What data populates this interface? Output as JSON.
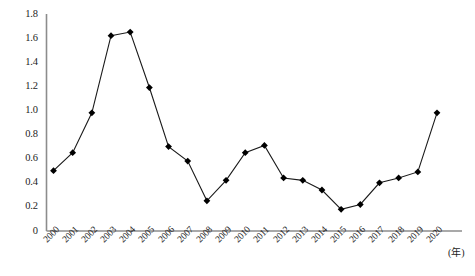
{
  "chart_data": {
    "type": "line",
    "title": "",
    "subtitle": "",
    "xlabel": "(年)",
    "ylabel": "",
    "grid": false,
    "legend": null,
    "legend_position": "none",
    "marker": "diamond",
    "line_color": "#1a1a1a",
    "marker_color": "#000000",
    "axis_color": "#8c8c8c",
    "categories": [
      "2000",
      "2001",
      "2002",
      "2003",
      "2004",
      "2005",
      "2006",
      "2007",
      "2008",
      "2009",
      "2010",
      "2011",
      "2012",
      "2013",
      "2014",
      "2015",
      "2016",
      "2017",
      "2018",
      "2019",
      "2020"
    ],
    "values": [
      0.5,
      0.65,
      0.98,
      1.62,
      1.65,
      1.19,
      0.7,
      0.58,
      0.25,
      0.42,
      0.65,
      0.71,
      0.44,
      0.42,
      0.34,
      0.18,
      0.22,
      0.4,
      0.44,
      0.49,
      0.98
    ],
    "ylim": [
      0,
      1.8
    ],
    "yticks": [
      0,
      0.2,
      0.4,
      0.6,
      0.8,
      1.0,
      1.2,
      1.4,
      1.6,
      1.8
    ],
    "ytick_labels": [
      "0",
      "0.2",
      "0.4",
      "0.6",
      "0.8",
      "1.0",
      "1.2",
      "1.4",
      "1.6",
      "1.8"
    ],
    "xtick_labels": [
      "2000",
      "2001",
      "2002",
      "2003",
      "2004",
      "2005",
      "2006",
      "2007",
      "2008",
      "2009",
      "2010",
      "2011",
      "2012",
      "2013",
      "2014",
      "2015",
      "2016",
      "2017",
      "2018",
      "2019",
      "2020"
    ]
  }
}
